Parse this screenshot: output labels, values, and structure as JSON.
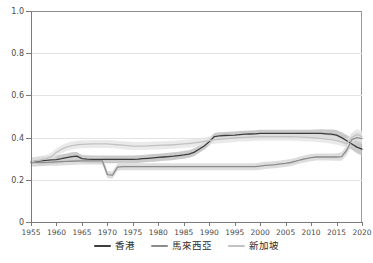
{
  "chart_title": "",
  "legend": {
    "position": "bottom-center",
    "entries": [
      {
        "label": "香港",
        "color": "#3d3d3d",
        "band_color": "#b8b8b8"
      },
      {
        "label": "馬來西亞",
        "color": "#8c8c8c",
        "band_color": "#d2d2d2"
      },
      {
        "label": "新加坡",
        "color": "#c2c2c2",
        "band_color": "#e3e3e3"
      }
    ]
  },
  "axes": {
    "y_ticks": [
      "0",
      "0.2",
      "0.4",
      "0.6",
      "0.8",
      "1.0"
    ],
    "y_values": [
      0,
      0.2,
      0.4,
      0.6,
      0.8,
      1.0
    ],
    "x_ticks": [
      "1955",
      "1960",
      "1965",
      "1970",
      "1975",
      "1980",
      "1985",
      "1990",
      "1995",
      "2000",
      "2005",
      "2010",
      "2015",
      "2020"
    ],
    "x_values": [
      1955,
      1960,
      1965,
      1970,
      1975,
      1980,
      1985,
      1990,
      1995,
      2000,
      2005,
      2010,
      2015,
      2020
    ],
    "xlim": [
      1955,
      2020
    ],
    "ylim": [
      0,
      1.0
    ],
    "grid": "horizontal"
  },
  "chart_data": {
    "type": "line",
    "title": "",
    "xlabel": "",
    "ylabel": "",
    "xlim": [
      1955,
      2020
    ],
    "ylim": [
      0,
      1.0
    ],
    "grid": true,
    "legend_position": "bottom-center",
    "x": [
      1955,
      1956,
      1957,
      1958,
      1959,
      1960,
      1961,
      1962,
      1963,
      1964,
      1965,
      1966,
      1967,
      1968,
      1969,
      1970,
      1971,
      1972,
      1973,
      1974,
      1975,
      1976,
      1977,
      1978,
      1979,
      1980,
      1981,
      1982,
      1983,
      1984,
      1985,
      1986,
      1987,
      1988,
      1989,
      1990,
      1991,
      1992,
      1993,
      1994,
      1995,
      1996,
      1997,
      1998,
      1999,
      2000,
      2001,
      2002,
      2003,
      2004,
      2005,
      2006,
      2007,
      2008,
      2009,
      2010,
      2011,
      2012,
      2013,
      2014,
      2015,
      2016,
      2017,
      2018,
      2019,
      2020
    ],
    "series": [
      {
        "name": "香港",
        "color": "#3d3d3d",
        "band_color": "#b8b8b8",
        "values": [
          0.285,
          0.288,
          0.29,
          0.292,
          0.294,
          0.296,
          0.3,
          0.305,
          0.31,
          0.312,
          0.3,
          0.298,
          0.297,
          0.297,
          0.297,
          0.297,
          0.297,
          0.297,
          0.297,
          0.297,
          0.297,
          0.298,
          0.3,
          0.302,
          0.304,
          0.306,
          0.308,
          0.31,
          0.312,
          0.315,
          0.318,
          0.322,
          0.33,
          0.345,
          0.36,
          0.38,
          0.405,
          0.408,
          0.41,
          0.411,
          0.412,
          0.414,
          0.416,
          0.417,
          0.418,
          0.42,
          0.42,
          0.42,
          0.42,
          0.42,
          0.42,
          0.42,
          0.42,
          0.42,
          0.42,
          0.42,
          0.42,
          0.42,
          0.418,
          0.416,
          0.412,
          0.4,
          0.385,
          0.37,
          0.355,
          0.345
        ],
        "band_low": [
          0.265,
          0.268,
          0.27,
          0.272,
          0.274,
          0.276,
          0.28,
          0.285,
          0.29,
          0.292,
          0.282,
          0.28,
          0.279,
          0.279,
          0.279,
          0.279,
          0.279,
          0.279,
          0.279,
          0.279,
          0.279,
          0.28,
          0.282,
          0.284,
          0.286,
          0.288,
          0.29,
          0.292,
          0.294,
          0.297,
          0.3,
          0.304,
          0.312,
          0.327,
          0.342,
          0.362,
          0.388,
          0.391,
          0.393,
          0.394,
          0.395,
          0.397,
          0.399,
          0.4,
          0.401,
          0.403,
          0.403,
          0.403,
          0.403,
          0.403,
          0.403,
          0.403,
          0.403,
          0.403,
          0.403,
          0.403,
          0.402,
          0.401,
          0.398,
          0.394,
          0.388,
          0.375,
          0.358,
          0.342,
          0.326,
          0.315
        ],
        "band_high": [
          0.305,
          0.308,
          0.31,
          0.312,
          0.314,
          0.316,
          0.32,
          0.325,
          0.33,
          0.332,
          0.318,
          0.316,
          0.315,
          0.315,
          0.315,
          0.315,
          0.315,
          0.315,
          0.315,
          0.315,
          0.315,
          0.316,
          0.318,
          0.32,
          0.322,
          0.324,
          0.326,
          0.328,
          0.33,
          0.333,
          0.336,
          0.34,
          0.348,
          0.363,
          0.378,
          0.398,
          0.422,
          0.425,
          0.427,
          0.428,
          0.429,
          0.431,
          0.433,
          0.434,
          0.435,
          0.437,
          0.437,
          0.437,
          0.437,
          0.437,
          0.437,
          0.437,
          0.437,
          0.437,
          0.437,
          0.437,
          0.438,
          0.439,
          0.438,
          0.438,
          0.436,
          0.425,
          0.412,
          0.398,
          0.384,
          0.375
        ]
      },
      {
        "name": "馬來西亞",
        "color": "#8c8c8c",
        "band_color": "#d2d2d2",
        "values": [
          0.28,
          0.281,
          0.282,
          0.283,
          0.284,
          0.285,
          0.286,
          0.287,
          0.288,
          0.289,
          0.29,
          0.29,
          0.29,
          0.29,
          0.29,
          0.225,
          0.222,
          0.26,
          0.262,
          0.262,
          0.262,
          0.262,
          0.262,
          0.262,
          0.262,
          0.262,
          0.262,
          0.262,
          0.262,
          0.262,
          0.262,
          0.262,
          0.262,
          0.262,
          0.262,
          0.262,
          0.262,
          0.262,
          0.262,
          0.262,
          0.262,
          0.262,
          0.262,
          0.262,
          0.262,
          0.265,
          0.268,
          0.27,
          0.272,
          0.275,
          0.278,
          0.282,
          0.288,
          0.295,
          0.3,
          0.305,
          0.308,
          0.308,
          0.308,
          0.308,
          0.308,
          0.31,
          0.34,
          0.39,
          0.4,
          0.395
        ],
        "band_low": [
          0.262,
          0.263,
          0.264,
          0.265,
          0.266,
          0.267,
          0.268,
          0.269,
          0.27,
          0.271,
          0.272,
          0.272,
          0.272,
          0.272,
          0.272,
          0.208,
          0.205,
          0.243,
          0.245,
          0.245,
          0.245,
          0.245,
          0.245,
          0.245,
          0.245,
          0.245,
          0.245,
          0.245,
          0.245,
          0.245,
          0.245,
          0.245,
          0.245,
          0.245,
          0.245,
          0.245,
          0.245,
          0.245,
          0.245,
          0.245,
          0.245,
          0.245,
          0.245,
          0.245,
          0.245,
          0.248,
          0.251,
          0.253,
          0.255,
          0.258,
          0.261,
          0.265,
          0.271,
          0.278,
          0.283,
          0.288,
          0.291,
          0.291,
          0.291,
          0.291,
          0.29,
          0.29,
          0.318,
          0.365,
          0.374,
          0.368
        ],
        "band_high": [
          0.298,
          0.299,
          0.3,
          0.301,
          0.302,
          0.303,
          0.304,
          0.305,
          0.306,
          0.307,
          0.308,
          0.308,
          0.308,
          0.308,
          0.308,
          0.242,
          0.239,
          0.277,
          0.279,
          0.279,
          0.279,
          0.279,
          0.279,
          0.279,
          0.279,
          0.279,
          0.279,
          0.279,
          0.279,
          0.279,
          0.279,
          0.279,
          0.279,
          0.279,
          0.279,
          0.279,
          0.279,
          0.279,
          0.279,
          0.279,
          0.279,
          0.279,
          0.279,
          0.279,
          0.279,
          0.282,
          0.285,
          0.287,
          0.289,
          0.292,
          0.295,
          0.299,
          0.305,
          0.312,
          0.317,
          0.322,
          0.325,
          0.325,
          0.325,
          0.325,
          0.326,
          0.33,
          0.362,
          0.415,
          0.426,
          0.422
        ]
      },
      {
        "name": "新加坡",
        "color": "#c2c2c2",
        "band_color": "#e3e3e3",
        "values": [
          0.285,
          0.29,
          0.295,
          0.3,
          0.31,
          0.33,
          0.345,
          0.355,
          0.362,
          0.366,
          0.368,
          0.369,
          0.37,
          0.37,
          0.37,
          0.37,
          0.368,
          0.366,
          0.364,
          0.362,
          0.36,
          0.36,
          0.36,
          0.361,
          0.362,
          0.363,
          0.364,
          0.365,
          0.366,
          0.368,
          0.37,
          0.372,
          0.375,
          0.378,
          0.382,
          0.386,
          0.39,
          0.392,
          0.394,
          0.396,
          0.398,
          0.4,
          0.401,
          0.402,
          0.403,
          0.404,
          0.404,
          0.404,
          0.404,
          0.404,
          0.404,
          0.404,
          0.403,
          0.402,
          0.401,
          0.4,
          0.398,
          0.396,
          0.393,
          0.39,
          0.386,
          0.38,
          0.372,
          0.4,
          0.415,
          0.405
        ],
        "band_low": [
          0.266,
          0.271,
          0.276,
          0.281,
          0.291,
          0.311,
          0.326,
          0.336,
          0.343,
          0.347,
          0.349,
          0.35,
          0.351,
          0.351,
          0.351,
          0.351,
          0.349,
          0.347,
          0.345,
          0.343,
          0.341,
          0.341,
          0.341,
          0.342,
          0.343,
          0.344,
          0.345,
          0.346,
          0.347,
          0.349,
          0.351,
          0.353,
          0.356,
          0.359,
          0.363,
          0.367,
          0.371,
          0.373,
          0.375,
          0.377,
          0.379,
          0.381,
          0.382,
          0.383,
          0.384,
          0.385,
          0.385,
          0.385,
          0.385,
          0.385,
          0.385,
          0.385,
          0.384,
          0.383,
          0.382,
          0.381,
          0.379,
          0.377,
          0.374,
          0.371,
          0.366,
          0.359,
          0.35,
          0.376,
          0.39,
          0.378
        ],
        "band_high": [
          0.304,
          0.309,
          0.314,
          0.319,
          0.329,
          0.349,
          0.364,
          0.374,
          0.381,
          0.385,
          0.387,
          0.388,
          0.389,
          0.389,
          0.389,
          0.389,
          0.387,
          0.385,
          0.383,
          0.381,
          0.379,
          0.379,
          0.379,
          0.38,
          0.381,
          0.382,
          0.383,
          0.384,
          0.385,
          0.387,
          0.389,
          0.391,
          0.394,
          0.397,
          0.401,
          0.405,
          0.409,
          0.411,
          0.413,
          0.415,
          0.417,
          0.419,
          0.42,
          0.421,
          0.422,
          0.423,
          0.423,
          0.423,
          0.423,
          0.423,
          0.423,
          0.423,
          0.422,
          0.421,
          0.42,
          0.419,
          0.417,
          0.415,
          0.412,
          0.409,
          0.406,
          0.401,
          0.394,
          0.424,
          0.44,
          0.432
        ]
      }
    ]
  }
}
